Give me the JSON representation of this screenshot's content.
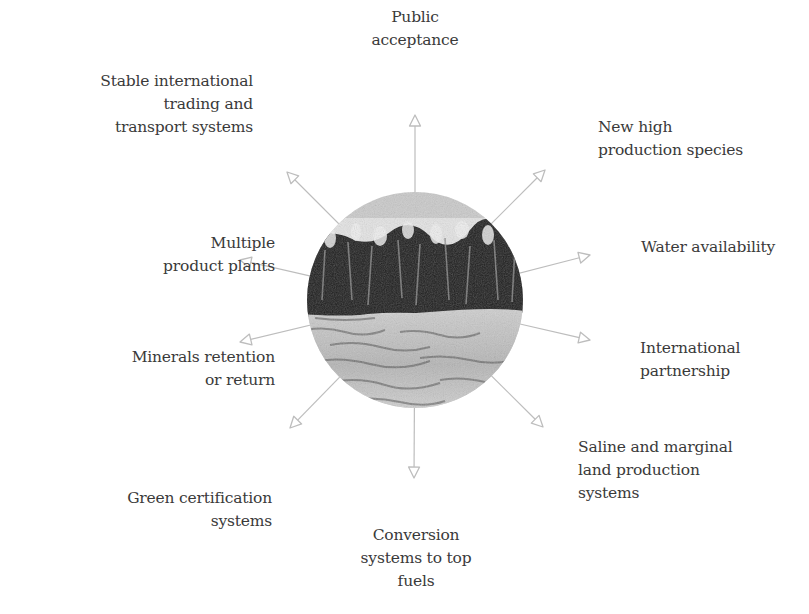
{
  "diagram": {
    "type": "radial-spoke",
    "center_image": {
      "description": "Circular grayscale photo of a tall grass/sugarcane crop field with sky above and cut field below",
      "center": [
        415,
        300
      ],
      "radius": 108
    },
    "spoke_color": "#bdbdbd",
    "text_color": "#3a3a3a",
    "spokes": [
      {
        "id": "public-acceptance",
        "label": "Public\nacceptance",
        "tip": [
          415,
          115
        ]
      },
      {
        "id": "new-high-production-species",
        "label": "New high\nproduction species",
        "tip": [
          545,
          170
        ]
      },
      {
        "id": "water-availability",
        "label": "Water availability",
        "tip": [
          590,
          255
        ]
      },
      {
        "id": "international-partnership",
        "label": "International\npartnership",
        "tip": [
          590,
          340
        ]
      },
      {
        "id": "saline-marginal-land",
        "label": "Saline and marginal\nland production\nsystems",
        "tip": [
          543,
          427
        ]
      },
      {
        "id": "conversion-systems",
        "label": "Conversion\nsystems to top\nfuels",
        "tip": [
          414,
          478
        ]
      },
      {
        "id": "green-certification",
        "label": "Green certification\nsystems",
        "tip": [
          290,
          428
        ]
      },
      {
        "id": "minerals-retention",
        "label": "Minerals retention\nor return",
        "tip": [
          240,
          342
        ]
      },
      {
        "id": "multiple-product-plants",
        "label": "Multiple\nproduct plants",
        "tip": [
          240,
          260
        ]
      },
      {
        "id": "stable-international-trading",
        "label": "Stable international\ntrading and\ntransport systems",
        "tip": [
          287,
          172
        ]
      }
    ]
  }
}
